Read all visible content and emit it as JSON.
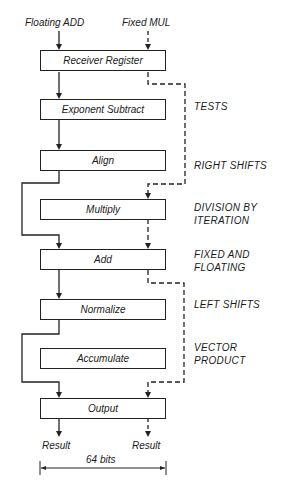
{
  "inputs": {
    "floating_add": "Floating ADD",
    "fixed_mul": "Fixed MUL"
  },
  "stages": [
    {
      "label": "Receiver Register",
      "top": 50
    },
    {
      "label": "Exponent Subtract",
      "top": 99
    },
    {
      "label": "Align",
      "top": 150
    },
    {
      "label": "Multiply",
      "top": 199
    },
    {
      "label": "Add",
      "top": 249
    },
    {
      "label": "Normalize",
      "top": 299
    },
    {
      "label": "Accumulate",
      "top": 348
    },
    {
      "label": "Output",
      "top": 398
    }
  ],
  "annotations": {
    "tests": "TESTS",
    "right_shifts": "RIGHT SHIFTS",
    "division_1": "DIVISION BY",
    "division_2": "ITERATION",
    "fixed_floating_1": "FIXED AND",
    "fixed_floating_2": "FLOATING",
    "left_shifts": "LEFT SHIFTS",
    "vector_1": "VECTOR",
    "vector_2": "PRODUCT"
  },
  "outputs": {
    "result_left": "Result",
    "result_right": "Result",
    "width_label": "64 bits"
  },
  "colors": {
    "line": "#222222",
    "background": "#ffffff"
  }
}
